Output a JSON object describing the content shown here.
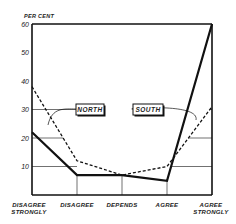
{
  "chart_data": {
    "type": "line",
    "title": "",
    "ylabel": "PER CENT",
    "xlabel": "",
    "ylim": [
      0,
      60
    ],
    "yticks": [
      10,
      20,
      30,
      40,
      50,
      60
    ],
    "ytick_labels": [
      "10",
      "20",
      "30",
      "40",
      "50",
      "60"
    ],
    "categories": [
      "DISAGREE STRONGLY",
      "DISAGREE",
      "DEPENDS",
      "AGREE",
      "AGREE STRONGLY"
    ],
    "category_lines": [
      [
        "DISAGREE",
        "STRONGLY"
      ],
      [
        "DISAGREE"
      ],
      [
        "DEPENDS"
      ],
      [
        "AGREE"
      ],
      [
        "AGREE",
        "STRONGLY"
      ]
    ],
    "series": [
      {
        "name": "NORTH",
        "style": "dashed",
        "values": [
          38,
          12,
          7,
          10,
          31
        ]
      },
      {
        "name": "SOUTH",
        "style": "solid",
        "values": [
          22,
          7,
          7,
          5,
          60
        ]
      }
    ],
    "legend": {
      "position": "inside-center",
      "entries": [
        "NORTH",
        "SOUTH"
      ]
    },
    "grid": false,
    "colors": {
      "line": "#111111",
      "background": "#ffffff"
    }
  }
}
